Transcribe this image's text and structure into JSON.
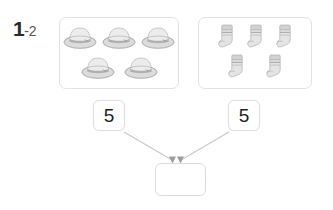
{
  "exercise": {
    "number": "1",
    "sub_number": "-2"
  },
  "groups": [
    {
      "name": "hats-group",
      "item_icon": "hat-icon",
      "count": 5,
      "rows": [
        3,
        2
      ]
    },
    {
      "name": "socks-group",
      "item_icon": "sock-icon",
      "count": 5,
      "rows": [
        3,
        2
      ]
    }
  ],
  "number_boxes": {
    "left_value": "5",
    "right_value": "5"
  },
  "answer_box": {
    "value": ""
  },
  "arrows": {
    "left_arrow_name": "arrow-left-to-answer",
    "right_arrow_name": "arrow-right-to-answer"
  },
  "colors": {
    "box_border": "#e2e2e2",
    "text": "#1f1f1f",
    "arrow": "#c9c9c9",
    "item_gray": "#d8d8d8",
    "item_gray_dark": "#a8a8a8"
  }
}
